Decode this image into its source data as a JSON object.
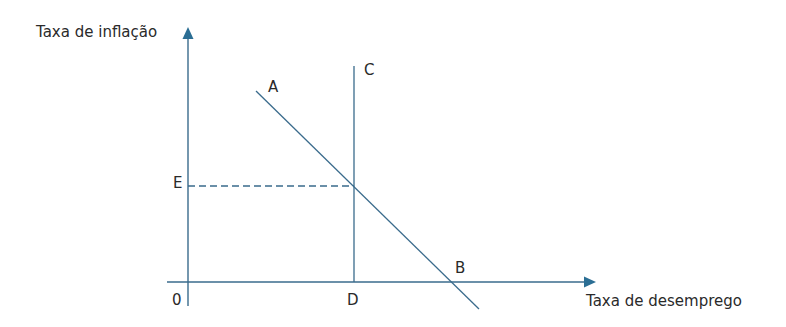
{
  "diagram": {
    "y_axis_label": "Taxa de inflação",
    "x_axis_label": "Taxa de desemprego",
    "origin_label": "0",
    "points": {
      "A": "A",
      "B": "B",
      "C": "C",
      "D": "D",
      "E": "E"
    },
    "colors": {
      "line": "#3a6b8c",
      "arrow": "#2b6e94",
      "text": "#2a2a2a"
    }
  }
}
